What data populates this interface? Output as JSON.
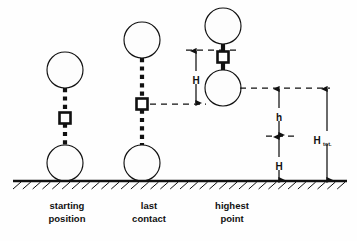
{
  "figure": {
    "background_color": "#fefefe",
    "ink_color": "#111111",
    "width": 357,
    "height": 241
  },
  "ground": {
    "label": "ground-line",
    "y": 181,
    "x_start": 13,
    "x_end": 347,
    "hatch_count": 34
  },
  "captions": [
    {
      "id": "starting-position",
      "line1": "starting",
      "line2": "position",
      "x": 67
    },
    {
      "id": "last-contact",
      "line1": "last",
      "line2": "contact",
      "x": 149
    },
    {
      "id": "highest-point",
      "line1": "highest",
      "line2": "point",
      "x": 232
    }
  ],
  "caption_lines": {
    "y1": 209,
    "y2": 222
  },
  "stages": [
    {
      "id": "starting-position",
      "cx": 65,
      "upper_ball": {
        "cy": 70,
        "r": 18
      },
      "lower_ball": {
        "cy": 163,
        "r": 18
      },
      "weight": {
        "cy": 118,
        "size": 11
      },
      "cord": {
        "y_top": 88,
        "y_bottom": 145
      }
    },
    {
      "id": "last-contact",
      "cx": 142,
      "upper_ball": {
        "cy": 40,
        "r": 18
      },
      "lower_ball": {
        "cy": 163,
        "r": 18
      },
      "weight": {
        "cy": 104,
        "size": 11
      },
      "cord": {
        "y_top": 58,
        "y_bottom": 145
      }
    },
    {
      "id": "highest-point",
      "cx": 223,
      "upper_ball": {
        "cy": 26,
        "r": 18
      },
      "lower_ball": {
        "cy": 88,
        "r": 18
      },
      "weight": {
        "cy": 57,
        "size": 11
      },
      "cord": {
        "y_top": 44,
        "y_bottom": 70
      }
    }
  ],
  "dimensions": [
    {
      "id": "H-upper",
      "label": "H",
      "subscript": "",
      "x": 196,
      "y_top": 50,
      "y_bottom": 104,
      "label_x": 196,
      "label_y": 80,
      "leader_top": {
        "x1": 186,
        "x2": 238,
        "y": 50
      },
      "leader_bottom": {
        "x1": 150,
        "x2": 206,
        "y": 104
      }
    },
    {
      "id": "h-rebound",
      "label": "h",
      "subscript": "",
      "x": 279,
      "y_top": 88,
      "y_bottom": 136,
      "label_x": 279,
      "label_y": 117,
      "leader_top": {
        "x1": 240,
        "x2": 330,
        "y": 88
      },
      "leader_bottom": {
        "x1": 266,
        "x2": 296,
        "y": 136
      }
    },
    {
      "id": "H-lower",
      "label": "H",
      "subscript": "",
      "x": 279,
      "y_top": 136,
      "y_bottom": 181,
      "label_x": 279,
      "label_y": 166,
      "leader_top": null,
      "leader_bottom": null
    },
    {
      "id": "H-total",
      "label": "H",
      "subscript": "tot.",
      "x": 327,
      "y_top": 88,
      "y_bottom": 181,
      "label_x": 317,
      "label_y": 140,
      "leader_top": null,
      "leader_bottom": null
    }
  ],
  "icons": {
    "ball": "circle-ball-icon",
    "weight": "square-weight-icon",
    "cord": "dotted-cord-icon",
    "arrow": "dimension-arrow-icon",
    "hatching": "ground-hatch-icon"
  }
}
